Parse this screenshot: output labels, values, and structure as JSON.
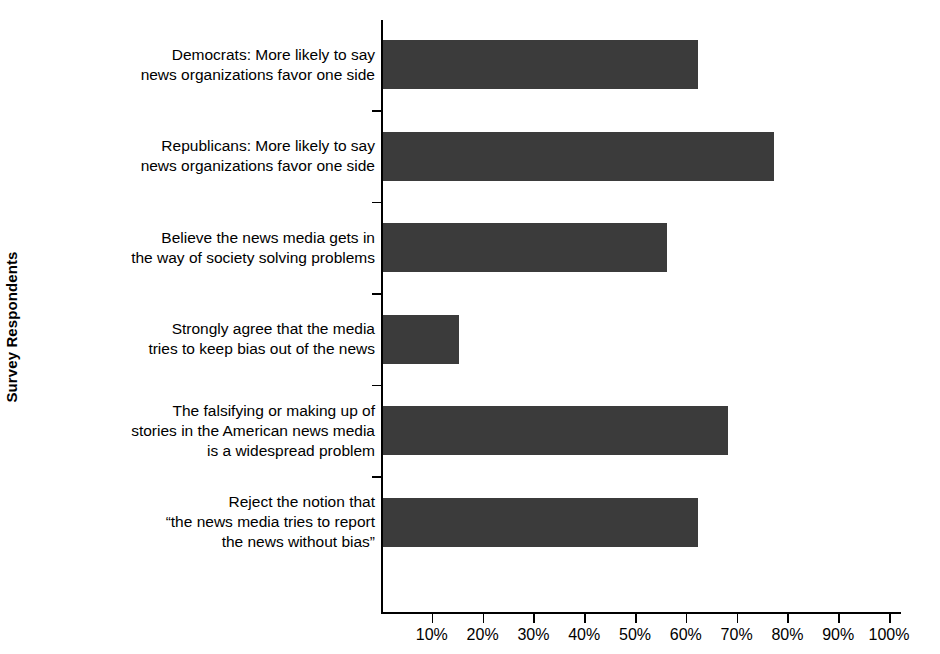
{
  "chart_data": {
    "type": "bar",
    "orientation": "horizontal",
    "title": "",
    "xlabel": "",
    "ylabel": "Survey Respondents",
    "xlim": [
      0,
      100
    ],
    "xtick_labels": [
      "10%",
      "20%",
      "30%",
      "40%",
      "50%",
      "60%",
      "70%",
      "80%",
      "90%",
      "100%"
    ],
    "xticks": [
      10,
      20,
      30,
      40,
      50,
      60,
      70,
      80,
      90,
      100
    ],
    "grid": false,
    "legend": null,
    "bar_color": "#3b3b3b",
    "axis_color": "#000000",
    "categories": [
      "Democrats: More likely to say\nnews organizations favor one side",
      "Republicans: More likely to say\nnews organizations favor one side",
      "Believe the news media gets in\nthe way of society solving problems",
      "Strongly agree that the media\ntries to keep bias out of the news",
      "The falsifying or making up of\nstories in the American news media\nis a widespread problem",
      "Reject the notion that\n“the news media tries to report\nthe news without bias”"
    ],
    "values": [
      62,
      77,
      56,
      15,
      68,
      62
    ]
  }
}
